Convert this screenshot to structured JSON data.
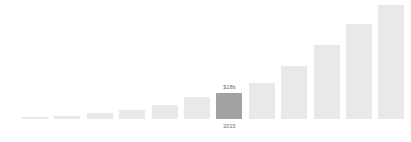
{
  "chart_data": {
    "type": "bar",
    "title": "",
    "subtitle": "",
    "xlabel": "",
    "ylabel": "",
    "grid": false,
    "legend": false,
    "legend_position": "none",
    "ylim": [
      0,
      120
    ],
    "categories": [
      "",
      "",
      "",
      "",
      "",
      "",
      "2015",
      "",
      "",
      "",
      "",
      ""
    ],
    "values": [
      1,
      2,
      4,
      6,
      10,
      15,
      18,
      25,
      37,
      51,
      66,
      79
    ],
    "value_unit": "b",
    "value_prefix": "$",
    "highlight_index": 6,
    "highlight_value_label": "$18b",
    "highlight_category_label": "2015",
    "colors": {
      "bar": "#e9e9e9",
      "bar_highlight": "#a2a2a2",
      "label_text": "#6b6b6b",
      "background": "#ffffff"
    },
    "bars": [
      {
        "index": 0,
        "value": 1,
        "value_label": "",
        "category_label": "",
        "highlighted": false
      },
      {
        "index": 1,
        "value": 2,
        "value_label": "",
        "category_label": "",
        "highlighted": false
      },
      {
        "index": 2,
        "value": 4,
        "value_label": "",
        "category_label": "",
        "highlighted": false
      },
      {
        "index": 3,
        "value": 6,
        "value_label": "",
        "category_label": "",
        "highlighted": false
      },
      {
        "index": 4,
        "value": 10,
        "value_label": "",
        "category_label": "",
        "highlighted": false
      },
      {
        "index": 5,
        "value": 15,
        "value_label": "",
        "category_label": "",
        "highlighted": false
      },
      {
        "index": 6,
        "value": 18,
        "value_label": "$18b",
        "category_label": "2015",
        "highlighted": true
      },
      {
        "index": 7,
        "value": 25,
        "value_label": "",
        "category_label": "",
        "highlighted": false
      },
      {
        "index": 8,
        "value": 37,
        "value_label": "",
        "category_label": "",
        "highlighted": false
      },
      {
        "index": 9,
        "value": 51,
        "value_label": "",
        "category_label": "",
        "highlighted": false
      },
      {
        "index": 10,
        "value": 66,
        "value_label": "",
        "category_label": "",
        "highlighted": false
      },
      {
        "index": 11,
        "value": 79,
        "value_label": "",
        "category_label": "",
        "highlighted": false
      }
    ]
  }
}
